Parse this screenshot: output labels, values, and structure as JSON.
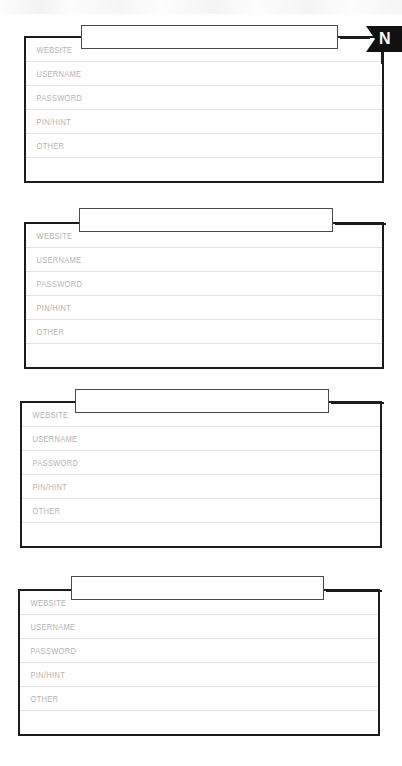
{
  "document": {
    "type": "password-log-form",
    "background_color": "#fefefe",
    "ink_color": "#1c1c1c",
    "rule_color": "#e3e3e3",
    "label_color": "#b3b3b3"
  },
  "corner_tag": {
    "label": "N",
    "background_color": "#111111",
    "text_color": "#ffffff",
    "shape": "ribbon-arrow-tag"
  },
  "row_labels": [
    "WEBSITE",
    "USERNAME",
    "PASSWORD",
    "PIN/HINT",
    "OTHER",
    ""
  ],
  "cards": [
    {
      "index": 1,
      "title": "",
      "title_placeholder": "",
      "has_corner_tag": true,
      "rows": [
        {
          "label": "WEBSITE",
          "value": "",
          "placeholder": ""
        },
        {
          "label": "USERNAME",
          "value": "",
          "placeholder": ""
        },
        {
          "label": "PASSWORD",
          "value": "",
          "placeholder": ""
        },
        {
          "label": "PIN/HINT",
          "value": "",
          "placeholder": ""
        },
        {
          "label": "OTHER",
          "value": "",
          "placeholder": ""
        },
        {
          "label": "",
          "value": "",
          "placeholder": ""
        }
      ]
    },
    {
      "index": 2,
      "title": "",
      "title_placeholder": "",
      "has_corner_tag": false,
      "rows": [
        {
          "label": "WEBSITE",
          "value": "",
          "placeholder": ""
        },
        {
          "label": "USERNAME",
          "value": "",
          "placeholder": ""
        },
        {
          "label": "PASSWORD",
          "value": "",
          "placeholder": ""
        },
        {
          "label": "PIN/HINT",
          "value": "",
          "placeholder": ""
        },
        {
          "label": "OTHER",
          "value": "",
          "placeholder": ""
        },
        {
          "label": "",
          "value": "",
          "placeholder": ""
        }
      ]
    },
    {
      "index": 3,
      "title": "",
      "title_placeholder": "",
      "has_corner_tag": false,
      "rows": [
        {
          "label": "WEBSITE",
          "value": "",
          "placeholder": ""
        },
        {
          "label": "USERNAME",
          "value": "",
          "placeholder": ""
        },
        {
          "label": "PASSWORD",
          "value": "",
          "placeholder": ""
        },
        {
          "label": "PIN/HINT",
          "value": "",
          "placeholder": ""
        },
        {
          "label": "OTHER",
          "value": "",
          "placeholder": ""
        },
        {
          "label": "",
          "value": "",
          "placeholder": ""
        }
      ]
    },
    {
      "index": 4,
      "title": "",
      "title_placeholder": "",
      "has_corner_tag": false,
      "rows": [
        {
          "label": "WEBSITE",
          "value": "",
          "placeholder": ""
        },
        {
          "label": "USERNAME",
          "value": "",
          "placeholder": ""
        },
        {
          "label": "PASSWORD",
          "value": "",
          "placeholder": ""
        },
        {
          "label": "PIN/HINT",
          "value": "",
          "placeholder": ""
        },
        {
          "label": "OTHER",
          "value": "",
          "placeholder": ""
        },
        {
          "label": "",
          "value": "",
          "placeholder": ""
        }
      ]
    }
  ],
  "geometry": {
    "cards": [
      {
        "left": 24,
        "top": 36,
        "width": 360,
        "height": 147,
        "title": {
          "left": 81,
          "top": 25,
          "width": 257,
          "height": 24
        },
        "stem": {
          "left": 338,
          "width": 30
        }
      },
      {
        "left": 24,
        "top": 222,
        "width": 360,
        "height": 147,
        "title": {
          "left": 79,
          "top": 208,
          "width": 254,
          "height": 24
        },
        "stem": {
          "left": 333,
          "width": 51
        }
      },
      {
        "left": 20,
        "top": 401,
        "width": 362,
        "height": 147,
        "title": {
          "left": 75,
          "top": 389,
          "width": 254,
          "height": 24
        },
        "stem": {
          "left": 329,
          "width": 53
        }
      },
      {
        "left": 18,
        "top": 589,
        "width": 362,
        "height": 147,
        "title": {
          "left": 71,
          "top": 576,
          "width": 253,
          "height": 24
        },
        "stem": {
          "left": 324,
          "width": 56
        }
      }
    ],
    "corner_tag": {
      "left": 366,
      "top": 26,
      "width": 36,
      "height": 26
    },
    "corner_tick": {
      "left": 381,
      "top": 50,
      "width": 2.5,
      "height": 14
    },
    "row_height": 24
  }
}
